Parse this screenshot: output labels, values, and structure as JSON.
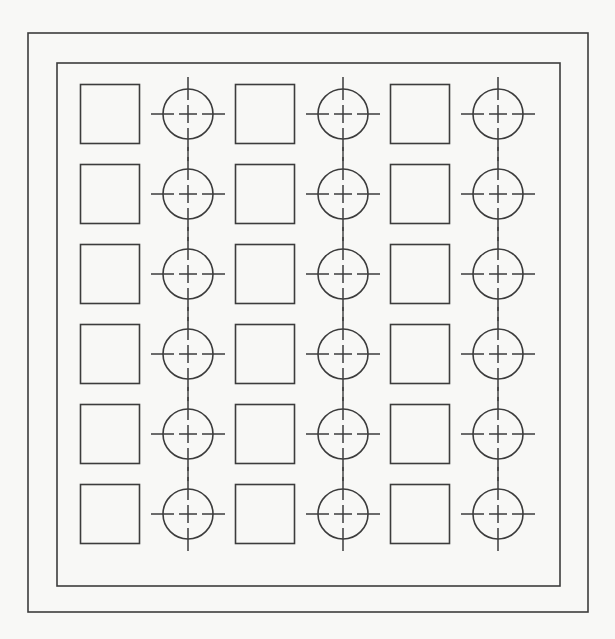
{
  "document": {
    "title": "Technical Drawing — Alternating Square and Circle Grid",
    "kind": "cad-line-drawing",
    "canvas": {
      "width": 615,
      "height": 639
    },
    "colors": {
      "background": "#f8f8f6",
      "line": "#3c3c3c",
      "fill": "none"
    }
  },
  "frame": {
    "outer": {
      "x": 28,
      "y": 33,
      "width": 560,
      "height": 579
    },
    "inner": {
      "x": 57,
      "y": 63,
      "width": 503,
      "height": 523
    }
  },
  "grid": {
    "rows": 6,
    "columns": 6,
    "column_centers": [
      110,
      188,
      265,
      343,
      420,
      498
    ],
    "row_centers": [
      114,
      194,
      274,
      354,
      434,
      514
    ],
    "column_pitch": 77.6,
    "row_pitch": 80,
    "pattern": "alternating",
    "square": {
      "size": 59
    },
    "circle": {
      "radius": 25
    },
    "centerline": {
      "overhang": 12,
      "center_cross_half": 9,
      "gap": 5,
      "link_dash_half": 7
    },
    "cells": [
      {
        "row": 0,
        "col": 0,
        "shape": "square"
      },
      {
        "row": 0,
        "col": 1,
        "shape": "circle"
      },
      {
        "row": 0,
        "col": 2,
        "shape": "square"
      },
      {
        "row": 0,
        "col": 3,
        "shape": "circle"
      },
      {
        "row": 0,
        "col": 4,
        "shape": "square"
      },
      {
        "row": 0,
        "col": 5,
        "shape": "circle"
      },
      {
        "row": 1,
        "col": 0,
        "shape": "square"
      },
      {
        "row": 1,
        "col": 1,
        "shape": "circle"
      },
      {
        "row": 1,
        "col": 2,
        "shape": "square"
      },
      {
        "row": 1,
        "col": 3,
        "shape": "circle"
      },
      {
        "row": 1,
        "col": 4,
        "shape": "square"
      },
      {
        "row": 1,
        "col": 5,
        "shape": "circle"
      },
      {
        "row": 2,
        "col": 0,
        "shape": "square"
      },
      {
        "row": 2,
        "col": 1,
        "shape": "circle"
      },
      {
        "row": 2,
        "col": 2,
        "shape": "square"
      },
      {
        "row": 2,
        "col": 3,
        "shape": "circle"
      },
      {
        "row": 2,
        "col": 4,
        "shape": "square"
      },
      {
        "row": 2,
        "col": 5,
        "shape": "circle"
      },
      {
        "row": 3,
        "col": 0,
        "shape": "square"
      },
      {
        "row": 3,
        "col": 1,
        "shape": "circle"
      },
      {
        "row": 3,
        "col": 2,
        "shape": "square"
      },
      {
        "row": 3,
        "col": 3,
        "shape": "circle"
      },
      {
        "row": 3,
        "col": 4,
        "shape": "square"
      },
      {
        "row": 3,
        "col": 5,
        "shape": "circle"
      },
      {
        "row": 4,
        "col": 0,
        "shape": "square"
      },
      {
        "row": 4,
        "col": 1,
        "shape": "circle"
      },
      {
        "row": 4,
        "col": 2,
        "shape": "square"
      },
      {
        "row": 4,
        "col": 3,
        "shape": "circle"
      },
      {
        "row": 4,
        "col": 4,
        "shape": "square"
      },
      {
        "row": 4,
        "col": 5,
        "shape": "circle"
      },
      {
        "row": 5,
        "col": 0,
        "shape": "square"
      },
      {
        "row": 5,
        "col": 1,
        "shape": "circle"
      },
      {
        "row": 5,
        "col": 2,
        "shape": "square"
      },
      {
        "row": 5,
        "col": 3,
        "shape": "circle"
      },
      {
        "row": 5,
        "col": 4,
        "shape": "square"
      },
      {
        "row": 5,
        "col": 5,
        "shape": "circle"
      }
    ]
  }
}
